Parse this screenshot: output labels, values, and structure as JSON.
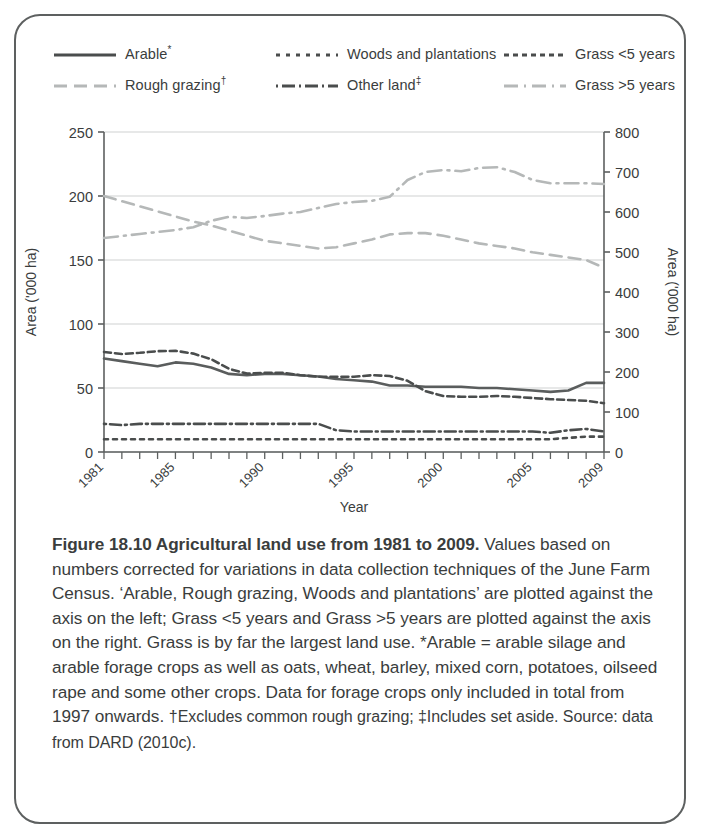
{
  "figure": {
    "caption_bold": "Figure 18.10 Agricultural land use from 1981 to 2009.",
    "caption_rest": " Values based on numbers corrected for variations in data collection techniques of the June Farm Census. ‘Arable, Rough grazing, Woods and plantations’ are plotted against the axis on the left; Grass <5 years and Grass >5 years are plotted against the axis on the right. Grass is by far the largest land use. *Arable = arable silage and arable forage crops as well as oats, wheat, barley, mixed corn, potatoes, oilseed rape and some other crops. Data for forage crops only included in total from 1997 onwards. ",
    "caption_dagger": "†Excludes common rough grazing; ‡Includes set aside. Source: data from DARD (2010c)."
  },
  "legend": {
    "items": [
      {
        "label": "Arable",
        "marker": "*",
        "style": "solid",
        "color": "#4a4d4d"
      },
      {
        "label": "Woods and plantations",
        "marker": "",
        "style": "dotted",
        "color": "#4a4d4d"
      },
      {
        "label": "Grass <5 years",
        "marker": "",
        "style": "dashed",
        "color": "#4a4d4d"
      },
      {
        "label": "Rough grazing",
        "marker": "†",
        "style": "longdash",
        "color": "#b5b8b8"
      },
      {
        "label": "Other land",
        "marker": "‡",
        "style": "dashdot",
        "color": "#4a4d4d"
      },
      {
        "label": "Grass >5 years",
        "marker": "",
        "style": "longdashdot",
        "color": "#b5b8b8"
      }
    ]
  },
  "chart_data": {
    "type": "line",
    "title": "",
    "xlabel": "Year",
    "ylabel": "Area ('000 ha)",
    "ylabel_right": "Area ('000 ha)",
    "grid": true,
    "legend_position": "top",
    "xlim": [
      1981,
      2009
    ],
    "ylim": [
      0,
      250
    ],
    "ylim_right": [
      0,
      800
    ],
    "yticks": [
      0,
      50,
      100,
      150,
      200,
      250
    ],
    "yticks_right": [
      0,
      100,
      200,
      300,
      400,
      500,
      600,
      700,
      800
    ],
    "x": [
      1981,
      1982,
      1983,
      1984,
      1985,
      1986,
      1987,
      1988,
      1989,
      1990,
      1991,
      1992,
      1993,
      1994,
      1995,
      1996,
      1997,
      1998,
      1999,
      2000,
      2001,
      2002,
      2003,
      2004,
      2005,
      2006,
      2007,
      2008,
      2009
    ],
    "xtick_labels": [
      "1981",
      "1985",
      "1990",
      "1995",
      "2000",
      "2005",
      "2009"
    ],
    "xtick_values": [
      1981,
      1985,
      1990,
      1995,
      2000,
      2005,
      2009
    ],
    "series": [
      {
        "name": "Arable",
        "axis": "left",
        "color": "#5a5d5d",
        "style": "solid",
        "values": [
          73,
          71,
          69,
          67,
          70,
          69,
          66,
          61,
          60,
          61,
          61,
          60,
          59,
          57,
          56,
          55,
          52,
          52,
          51,
          51,
          51,
          50,
          50,
          49,
          48,
          47,
          48,
          54,
          54
        ]
      },
      {
        "name": "Rough grazing",
        "axis": "left",
        "color": "#b5b8b8",
        "style": "longdash",
        "values": [
          200,
          196,
          192,
          188,
          184,
          180,
          177,
          173,
          169,
          165,
          163,
          161,
          159,
          160,
          163,
          166,
          170,
          171,
          171,
          169,
          166,
          163,
          161,
          159,
          156,
          154,
          152,
          150,
          144
        ]
      },
      {
        "name": "Woods and plantations",
        "axis": "left",
        "color": "#4a4d4d",
        "style": "dotted",
        "values": [
          10,
          10,
          10,
          10,
          10,
          10,
          10,
          10,
          10,
          10,
          10,
          10,
          10,
          10,
          10,
          10,
          10,
          10,
          10,
          10,
          10,
          10,
          10,
          10,
          10,
          10,
          11,
          12,
          12
        ]
      },
      {
        "name": "Other land",
        "axis": "left",
        "color": "#4a4d4d",
        "style": "dashdot",
        "values": [
          22,
          21,
          22,
          22,
          22,
          22,
          22,
          22,
          22,
          22,
          22,
          22,
          22,
          17,
          16,
          16,
          16,
          16,
          16,
          16,
          16,
          16,
          16,
          16,
          16,
          15,
          17,
          18,
          16
        ]
      },
      {
        "name": "Grass <5 years",
        "axis": "right",
        "color": "#4a4d4d",
        "style": "dashed",
        "values": [
          250,
          245,
          248,
          252,
          253,
          246,
          232,
          208,
          196,
          198,
          198,
          192,
          188,
          188,
          188,
          192,
          190,
          178,
          152,
          140,
          138,
          138,
          140,
          138,
          135,
          132,
          130,
          128,
          122
        ]
      },
      {
        "name": "Grass >5 years",
        "axis": "right",
        "color": "#b5b8b8",
        "style": "longdashdot",
        "values": [
          535,
          540,
          545,
          550,
          555,
          562,
          578,
          588,
          585,
          590,
          596,
          600,
          610,
          620,
          625,
          628,
          638,
          680,
          700,
          705,
          702,
          710,
          712,
          700,
          680,
          672,
          672,
          672,
          670
        ]
      }
    ]
  }
}
